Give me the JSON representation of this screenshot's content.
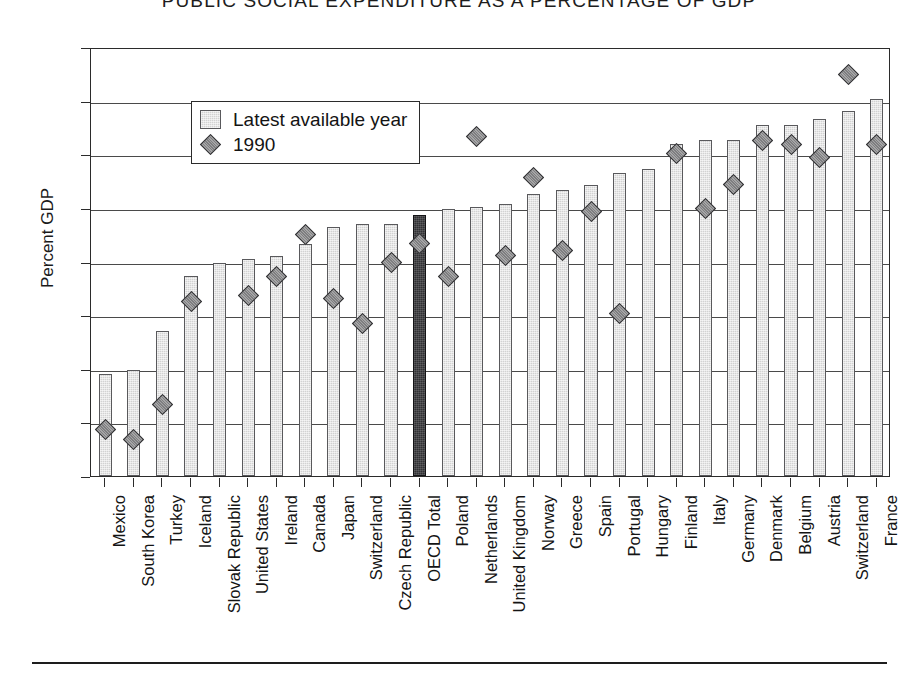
{
  "title": "PUBLIC SOCIAL EXPENDITURE AS A PERCENTAGE OF GDP",
  "axis": {
    "ylabel": "Percent GDP"
  },
  "legend": {
    "items": [
      {
        "label": "Latest available year",
        "marker": "square-swatch"
      },
      {
        "label": "1990",
        "marker": "diamond-swatch"
      }
    ]
  },
  "colors": {
    "bar_fill": "#d2d2d2",
    "bar_edge": "#59595c",
    "highlight_fill": "#303033",
    "marker_fill": "#7e7e80",
    "marker_edge": "#2f2f31",
    "axis": "#2b2b2b",
    "grid": "#4a4a4a"
  },
  "chart_data": {
    "type": "bar",
    "title": "PUBLIC SOCIAL EXPENDITURE AS A PERCENTAGE OF GDP",
    "xlabel": "",
    "ylabel": "Percent GDP",
    "ylim": [
      0,
      32
    ],
    "yticks": [
      0,
      4,
      8,
      12,
      16,
      20,
      24,
      28,
      32
    ],
    "grid": true,
    "legend_position": "upper-left-inside",
    "highlight_category": "OECD Total",
    "categories": [
      "Mexico",
      "South Korea",
      "Turkey",
      "Iceland",
      "Slovak Republic",
      "United States",
      "Ireland",
      "Canada",
      "Japan",
      "Switzerland",
      "Czech Republic",
      "OECD Total",
      "Poland",
      "Netherlands",
      "United Kingdom",
      "Norway",
      "Greece",
      "Spain",
      "Portugal",
      "Hungary",
      "Finland",
      "Italy",
      "Germany",
      "Denmark",
      "Belgium",
      "Austria",
      "Switzerland",
      "France"
    ],
    "series": [
      {
        "name": "Latest available year",
        "type": "bar",
        "values": [
          7.6,
          7.9,
          10.8,
          14.9,
          15.9,
          16.2,
          16.4,
          17.3,
          18.6,
          18.8,
          18.8,
          19.5,
          19.9,
          20.1,
          20.3,
          21.0,
          21.3,
          21.7,
          22.6,
          22.9,
          24.8,
          25.1,
          25.1,
          26.2,
          26.2,
          26.6,
          27.2,
          28.1
        ]
      },
      {
        "name": "1990",
        "type": "scatter",
        "marker": "diamond",
        "values": [
          3.6,
          2.9,
          5.5,
          13.2,
          null,
          13.6,
          15.0,
          18.2,
          13.4,
          11.5,
          16.1,
          17.5,
          15.0,
          25.5,
          16.6,
          22.4,
          17.0,
          19.9,
          12.3,
          null,
          24.2,
          20.1,
          21.9,
          25.2,
          24.9,
          23.9,
          30.1,
          24.9
        ]
      }
    ]
  }
}
